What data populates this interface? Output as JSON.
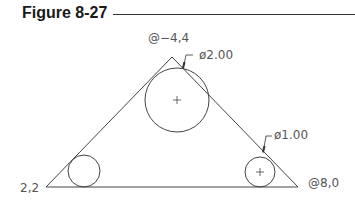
{
  "figure": {
    "title": "Figure 8-27"
  },
  "labels": {
    "apex": "@−4,4",
    "bottom_left": "2,2",
    "bottom_right": "@8,0",
    "large_circle_dim": "ø2.00",
    "small_circle_dim": "ø1.00"
  },
  "colors": {
    "line": "#444444",
    "text": "#555555"
  }
}
